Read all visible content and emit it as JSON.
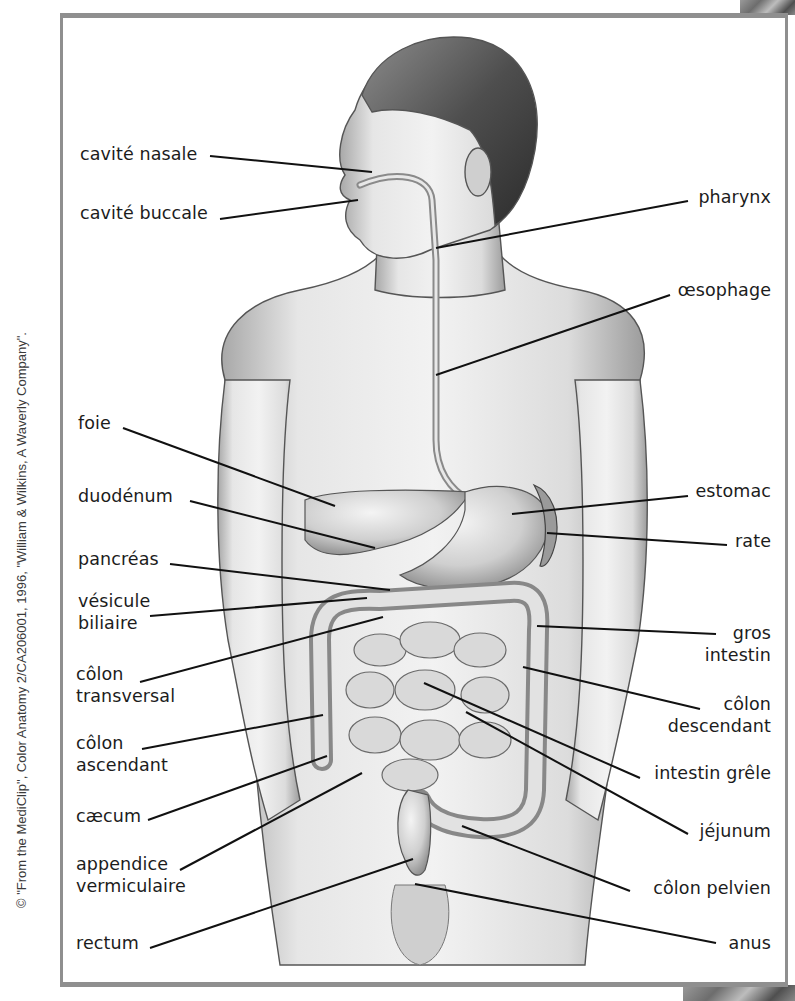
{
  "diagram": {
    "type": "anatomical-labeled-illustration",
    "frame_color": "#8f8f8f",
    "line_color": "#111111",
    "credit": "© \"From the MediClip\", Color Anatomy 2/CA206001, 1996, \"William & Wilkins, A Waverly Company\"."
  },
  "labels_left": [
    {
      "id": "cavite-nasale",
      "lines": [
        "cavité nasale"
      ],
      "x": 80,
      "y": 143,
      "line": [
        210,
        156,
        372,
        172
      ]
    },
    {
      "id": "cavite-buccale",
      "lines": [
        "cavité buccale"
      ],
      "x": 80,
      "y": 202,
      "line": [
        220,
        219,
        358,
        200
      ]
    },
    {
      "id": "foie",
      "lines": [
        "foie"
      ],
      "x": 78,
      "y": 412,
      "line": [
        123,
        428,
        335,
        506
      ]
    },
    {
      "id": "duodenum",
      "lines": [
        "duodénum"
      ],
      "x": 78,
      "y": 485,
      "line": [
        190,
        501,
        375,
        548
      ]
    },
    {
      "id": "pancreas",
      "lines": [
        "pancréas"
      ],
      "x": 78,
      "y": 548,
      "line": [
        170,
        564,
        390,
        590
      ]
    },
    {
      "id": "vesicule-biliaire",
      "lines": [
        "vésicule",
        "biliaire"
      ],
      "x": 78,
      "y": 590,
      "line": [
        150,
        616,
        367,
        598
      ]
    },
    {
      "id": "colon-transversal",
      "lines": [
        "côlon",
        "transversal"
      ],
      "x": 76,
      "y": 663,
      "line": [
        140,
        682,
        383,
        617
      ]
    },
    {
      "id": "colon-ascendant",
      "lines": [
        "côlon",
        "ascendant"
      ],
      "x": 76,
      "y": 732,
      "line": [
        142,
        749,
        323,
        715
      ]
    },
    {
      "id": "caecum",
      "lines": [
        "cæcum"
      ],
      "x": 76,
      "y": 805,
      "line": [
        148,
        820,
        327,
        756
      ]
    },
    {
      "id": "appendice-vermiculaire",
      "lines": [
        "appendice",
        "vermiculaire"
      ],
      "x": 76,
      "y": 853,
      "line": [
        180,
        870,
        362,
        773
      ]
    },
    {
      "id": "rectum",
      "lines": [
        "rectum"
      ],
      "x": 76,
      "y": 932,
      "line": [
        150,
        948,
        413,
        859
      ]
    }
  ],
  "labels_right": [
    {
      "id": "pharynx",
      "lines": [
        "pharynx"
      ],
      "right": 24,
      "y": 186,
      "line": [
        688,
        201,
        436,
        248
      ]
    },
    {
      "id": "oesophage",
      "lines": [
        "œsophage"
      ],
      "right": 24,
      "y": 279,
      "line": [
        670,
        295,
        436,
        375
      ]
    },
    {
      "id": "estomac",
      "lines": [
        "estomac"
      ],
      "right": 24,
      "y": 480,
      "line": [
        688,
        496,
        512,
        514
      ]
    },
    {
      "id": "rate",
      "lines": [
        "rate"
      ],
      "right": 24,
      "y": 530,
      "line": [
        727,
        545,
        547,
        533
      ]
    },
    {
      "id": "gros-intestin",
      "lines": [
        "gros",
        "intestin"
      ],
      "right": 24,
      "y": 622,
      "line": [
        716,
        634,
        537,
        626
      ]
    },
    {
      "id": "colon-descendant",
      "lines": [
        "côlon",
        "descendant"
      ],
      "right": 24,
      "y": 693,
      "line": [
        700,
        709,
        523,
        667
      ]
    },
    {
      "id": "intestin-grele",
      "lines": [
        "intestin grêle"
      ],
      "right": 24,
      "y": 762,
      "line": [
        640,
        778,
        424,
        683
      ]
    },
    {
      "id": "jejunum",
      "lines": [
        "jéjunum"
      ],
      "right": 24,
      "y": 820,
      "line": [
        688,
        834,
        466,
        712
      ]
    },
    {
      "id": "colon-pelvien",
      "lines": [
        "côlon pelvien"
      ],
      "right": 24,
      "y": 877,
      "line": [
        630,
        891,
        462,
        826
      ]
    },
    {
      "id": "anus",
      "lines": [
        "anus"
      ],
      "right": 24,
      "y": 932,
      "line": [
        716,
        943,
        415,
        884
      ]
    }
  ]
}
